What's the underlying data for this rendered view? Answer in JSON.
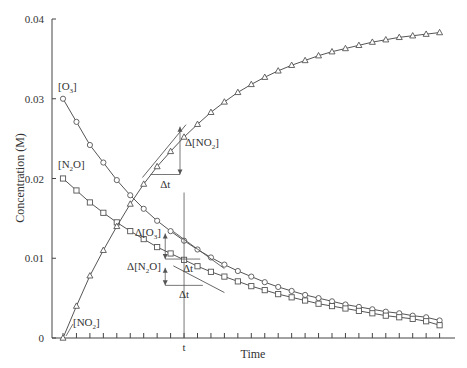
{
  "chart_data": {
    "type": "line",
    "title": "",
    "xlabel": "Time",
    "ylabel": "Concentration (M)",
    "ylim": [
      0,
      0.04
    ],
    "yticks": [
      "0",
      "0.01",
      "0.02",
      "0.03",
      "0.04"
    ],
    "xticks_label": "t",
    "x_index": [
      0,
      1,
      2,
      3,
      4,
      5,
      6,
      7,
      8,
      9,
      10,
      11,
      12,
      13,
      14,
      15,
      16,
      17,
      18,
      19,
      20,
      21,
      22,
      23,
      24,
      25,
      26,
      27,
      28
    ],
    "series": [
      {
        "name": "[O3]",
        "label_main": "[O",
        "label_sub": "3",
        "label_end": "]",
        "marker": "circle",
        "values": [
          0.03,
          0.0271,
          0.0242,
          0.022,
          0.0198,
          0.0179,
          0.0162,
          0.0147,
          0.0134,
          0.0122,
          0.0111,
          0.0101,
          0.0092,
          0.0084,
          0.0077,
          0.007,
          0.0064,
          0.0059,
          0.0054,
          0.005,
          0.0046,
          0.0042,
          0.0039,
          0.0036,
          0.0033,
          0.0031,
          0.0028,
          0.0026,
          0.0022
        ]
      },
      {
        "name": "[N2O]",
        "label_main": "[N",
        "label_sub": "2",
        "label_end": "O]",
        "marker": "square",
        "values": [
          0.02,
          0.0185,
          0.017,
          0.0157,
          0.0145,
          0.0134,
          0.0124,
          0.0114,
          0.0106,
          0.0098,
          0.009,
          0.0083,
          0.0077,
          0.0071,
          0.0065,
          0.006,
          0.0055,
          0.0051,
          0.0047,
          0.0043,
          0.004,
          0.0037,
          0.0034,
          0.0031,
          0.0028,
          0.0026,
          0.0024,
          0.0021,
          0.0016
        ]
      },
      {
        "name": "[NO2]",
        "label_main": "[NO",
        "label_sub": "2",
        "label_end": "]",
        "marker": "triangle",
        "values": [
          0.0,
          0.004,
          0.0078,
          0.011,
          0.014,
          0.0168,
          0.0193,
          0.0215,
          0.0234,
          0.0252,
          0.0268,
          0.0283,
          0.0296,
          0.0308,
          0.0318,
          0.0327,
          0.0335,
          0.0342,
          0.0348,
          0.0354,
          0.0359,
          0.0363,
          0.0367,
          0.0371,
          0.0374,
          0.0377,
          0.0379,
          0.0381,
          0.0383
        ]
      }
    ],
    "annotations": {
      "t_index": 9,
      "delta_NO2": {
        "main": "Δ[NO",
        "sub": "2",
        "end": "]"
      },
      "delta_O3": {
        "main": "Δ[O",
        "sub": "3",
        "end": "]"
      },
      "delta_N2O": {
        "main": "Δ[N",
        "sub": "2",
        "end": "O]"
      },
      "delta_t": "Δt"
    },
    "grid": false,
    "legend": "inline labels"
  },
  "colors": {
    "line": "#555555",
    "axis": "#444444",
    "text": "#333333",
    "background": "#ffffff"
  }
}
